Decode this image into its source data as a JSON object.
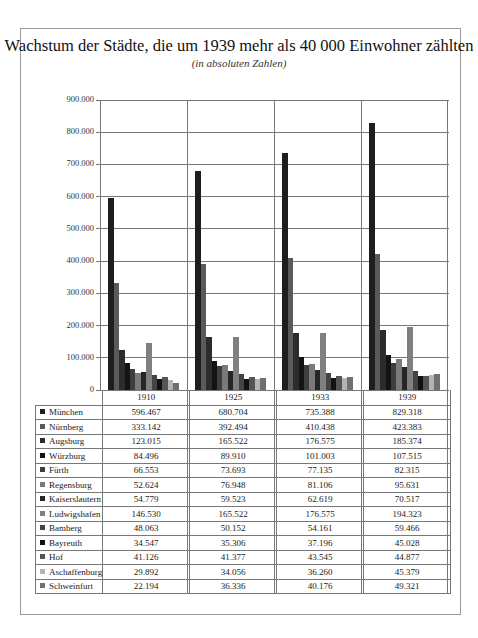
{
  "chart_data": {
    "type": "bar",
    "title": "Wachstum der Städte, die um 1939 mehr als 40 000 Einwohner zählten",
    "subtitle": "(in absoluten Zahlen)",
    "xlabel": "",
    "ylabel": "",
    "ylim": [
      0,
      900000
    ],
    "grid": true,
    "legend_position": "data-table-below",
    "categories": [
      "1910",
      "1925",
      "1933",
      "1939"
    ],
    "y_ticks": [
      "0",
      "100.000",
      "200.000",
      "300.000",
      "400.000",
      "500.000",
      "600.000",
      "700.000",
      "800.000",
      "900.000"
    ],
    "series": [
      {
        "name": "München",
        "color": "#1e1e1e",
        "values": [
          596467,
          680704,
          735388,
          829318
        ],
        "labels": [
          "596.467",
          "680.704",
          "735.388",
          "829.318"
        ]
      },
      {
        "name": "Nürnberg",
        "color": "#5a5a5a",
        "values": [
          333142,
          392494,
          410438,
          423383
        ],
        "labels": [
          "333.142",
          "392.494",
          "410.438",
          "423.383"
        ]
      },
      {
        "name": "Augsburg",
        "color": "#2c2c2c",
        "values": [
          123015,
          165522,
          176575,
          185374
        ],
        "labels": [
          "123.015",
          "165.522",
          "176.575",
          "185.374"
        ]
      },
      {
        "name": "Würzburg",
        "color": "#141414",
        "values": [
          84496,
          89910,
          101003,
          107515
        ],
        "labels": [
          "84.496",
          "89.910",
          "101.003",
          "107.515"
        ]
      },
      {
        "name": "Fürth",
        "color": "#3e3e3e",
        "values": [
          66553,
          73693,
          77135,
          82315
        ],
        "labels": [
          "66.553",
          "73.693",
          "77.135",
          "82.315"
        ]
      },
      {
        "name": "Regensburg",
        "color": "#7a7a7a",
        "values": [
          52624,
          76948,
          81106,
          95631
        ],
        "labels": [
          "52.624",
          "76.948",
          "81.106",
          "95.631"
        ]
      },
      {
        "name": "Kaiserslautern",
        "color": "#262626",
        "values": [
          54779,
          59523,
          62619,
          70517
        ],
        "labels": [
          "54.779",
          "59.523",
          "62.619",
          "70.517"
        ]
      },
      {
        "name": "Ludwigshafen",
        "color": "#808080",
        "values": [
          146530,
          165522,
          176575,
          194323
        ],
        "labels": [
          "146.530",
          "165.522",
          "176.575",
          "194.323"
        ]
      },
      {
        "name": "Bamberg",
        "color": "#444444",
        "values": [
          48063,
          50152,
          54161,
          59466
        ],
        "labels": [
          "48.063",
          "50.152",
          "54.161",
          "59.466"
        ]
      },
      {
        "name": "Bayreuth",
        "color": "#121212",
        "values": [
          34547,
          35306,
          37196,
          45028
        ],
        "labels": [
          "34.547",
          "35.306",
          "37.196",
          "45.028"
        ]
      },
      {
        "name": "Hof",
        "color": "#555555",
        "values": [
          41126,
          41377,
          43545,
          44877
        ],
        "labels": [
          "41.126",
          "41.377",
          "43.545",
          "44.877"
        ]
      },
      {
        "name": "Aschaffenburg",
        "color": "#b4b4b4",
        "values": [
          29892,
          34056,
          36260,
          45379
        ],
        "labels": [
          "29.892",
          "34.056",
          "36.260",
          "45.379"
        ]
      },
      {
        "name": "Schweinfurt",
        "color": "#707070",
        "values": [
          22194,
          36336,
          40176,
          49321
        ],
        "labels": [
          "22.194",
          "36.336",
          "40.176",
          "49.321"
        ]
      }
    ]
  }
}
